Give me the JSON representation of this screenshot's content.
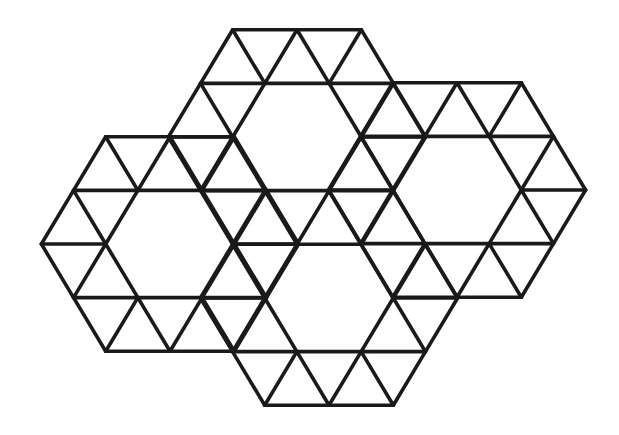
{
  "diagram": {
    "type": "triangle-lattice-tiling",
    "stroke_color": "#1a1a1a",
    "background": "#ffffff",
    "stroke_width": 3.6,
    "lattice": {
      "origin_x": 232.3,
      "origin_y": 30,
      "dx": 64.3,
      "dy": 53.6
    },
    "units": [
      {
        "name": "top-ring",
        "hole_center": [
          297,
          137
        ]
      },
      {
        "name": "left-ring",
        "hole_center": [
          170,
          244
        ]
      },
      {
        "name": "right-ring",
        "hole_center": [
          457,
          190
        ]
      },
      {
        "name": "bottom-ring",
        "hole_center": [
          329,
          298
        ]
      }
    ]
  }
}
